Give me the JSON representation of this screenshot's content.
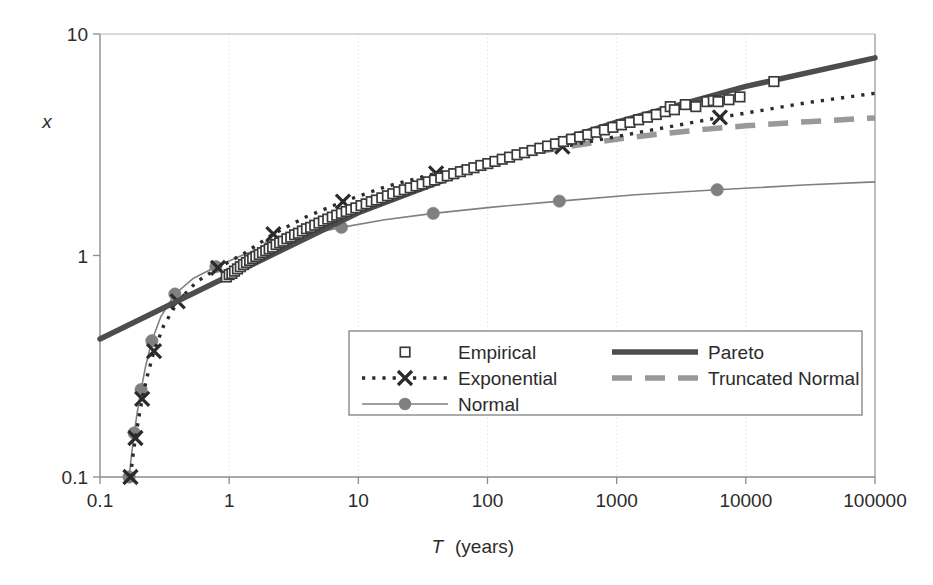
{
  "chart_data": {
    "type": "line",
    "title": "",
    "xlabel": "T (years)",
    "xlabel_symbol": "T",
    "xlabel_unit": "(years)",
    "ylabel": "x",
    "xscale": "log",
    "yscale": "log",
    "xlim": [
      0.1,
      100000
    ],
    "ylim": [
      0.1,
      10
    ],
    "xticks": [
      "0.1",
      "1",
      "10",
      "100",
      "1000",
      "10000",
      "100000"
    ],
    "xtick_values": [
      0.1,
      1,
      10,
      100,
      1000,
      10000,
      100000
    ],
    "yticks": [
      "0.1",
      "1",
      "10"
    ],
    "ytick_values": [
      0.1,
      1,
      10
    ],
    "grid": "vertical-dotted-at-decades",
    "legend_position": "lower-center",
    "series": [
      {
        "name": "Empirical",
        "marker": "open-square",
        "line": "none",
        "color": "#3a3a3a",
        "points": [
          [
            0.95,
            0.8
          ],
          [
            1.0,
            0.82
          ],
          [
            1.05,
            0.83
          ],
          [
            1.1,
            0.85
          ],
          [
            1.16,
            0.87
          ],
          [
            1.22,
            0.89
          ],
          [
            1.29,
            0.91
          ],
          [
            1.36,
            0.93
          ],
          [
            1.44,
            0.95
          ],
          [
            1.52,
            0.97
          ],
          [
            1.61,
            0.99
          ],
          [
            1.71,
            1.01
          ],
          [
            1.81,
            1.03
          ],
          [
            1.92,
            1.05
          ],
          [
            2.04,
            1.07
          ],
          [
            2.17,
            1.09
          ],
          [
            2.31,
            1.12
          ],
          [
            2.46,
            1.14
          ],
          [
            2.62,
            1.16
          ],
          [
            2.8,
            1.19
          ],
          [
            3.0,
            1.21
          ],
          [
            3.21,
            1.24
          ],
          [
            3.44,
            1.26
          ],
          [
            3.69,
            1.29
          ],
          [
            3.97,
            1.32
          ],
          [
            4.27,
            1.34
          ],
          [
            4.6,
            1.37
          ],
          [
            4.96,
            1.4
          ],
          [
            5.36,
            1.43
          ],
          [
            5.8,
            1.46
          ],
          [
            6.28,
            1.49
          ],
          [
            6.81,
            1.52
          ],
          [
            7.4,
            1.55
          ],
          [
            8.05,
            1.58
          ],
          [
            8.77,
            1.61
          ],
          [
            9.57,
            1.64
          ],
          [
            10.5,
            1.68
          ],
          [
            11.5,
            1.71
          ],
          [
            12.6,
            1.75
          ],
          [
            13.8,
            1.78
          ],
          [
            15.2,
            1.82
          ],
          [
            16.8,
            1.86
          ],
          [
            18.5,
            1.9
          ],
          [
            20.5,
            1.94
          ],
          [
            22.7,
            1.98
          ],
          [
            25.2,
            2.02
          ],
          [
            28.0,
            2.06
          ],
          [
            31.2,
            2.1
          ],
          [
            34.8,
            2.15
          ],
          [
            38.9,
            2.19
          ],
          [
            43.5,
            2.24
          ],
          [
            48.8,
            2.29
          ],
          [
            54.8,
            2.34
          ],
          [
            61.7,
            2.39
          ],
          [
            69.5,
            2.44
          ],
          [
            78.5,
            2.49
          ],
          [
            88.8,
            2.55
          ],
          [
            100.6,
            2.6
          ],
          [
            114.2,
            2.66
          ],
          [
            130.0,
            2.72
          ],
          [
            148.2,
            2.78
          ],
          [
            169.2,
            2.85
          ],
          [
            193.5,
            2.91
          ],
          [
            221.6,
            2.98
          ],
          [
            254.2,
            3.05
          ],
          [
            292.0,
            3.12
          ],
          [
            336.0,
            3.19
          ],
          [
            387.2,
            3.27
          ],
          [
            447.0,
            3.35
          ],
          [
            516.6,
            3.43
          ],
          [
            597.8,
            3.51
          ],
          [
            693.0,
            3.6
          ],
          [
            804.5,
            3.69
          ],
          [
            935.0,
            3.79
          ],
          [
            1088.0,
            3.89
          ],
          [
            1268.0,
            3.99
          ],
          [
            1480.0,
            4.1
          ],
          [
            1731.0,
            4.21
          ],
          [
            2028.0,
            4.33
          ],
          [
            2380.0,
            4.46
          ],
          [
            2600.0,
            4.7
          ],
          [
            2800.0,
            4.55
          ],
          [
            3400.0,
            4.8
          ],
          [
            4100.0,
            4.7
          ],
          [
            5000.0,
            4.95
          ],
          [
            5600.0,
            5.0
          ],
          [
            6100.0,
            4.95
          ],
          [
            7400.0,
            5.05
          ],
          [
            9000.0,
            5.2
          ],
          [
            16500.0,
            6.1
          ]
        ]
      },
      {
        "name": "Exponential",
        "marker": "x",
        "line": "dotted",
        "color": "#2b2b2b",
        "points": [
          [
            0.172,
            0.1
          ],
          [
            0.18,
            0.125
          ],
          [
            0.188,
            0.15
          ],
          [
            0.198,
            0.18
          ],
          [
            0.212,
            0.225
          ],
          [
            0.232,
            0.285
          ],
          [
            0.262,
            0.37
          ],
          [
            0.31,
            0.48
          ],
          [
            0.4,
            0.62
          ],
          [
            0.56,
            0.76
          ],
          [
            0.82,
            0.88
          ],
          [
            1.3,
            1.02
          ],
          [
            2.2,
            1.25
          ],
          [
            4.0,
            1.5
          ],
          [
            7.6,
            1.75
          ],
          [
            16.5,
            2.05
          ],
          [
            40.0,
            2.35
          ],
          [
            110.0,
            2.7
          ],
          [
            380.0,
            3.1
          ],
          [
            1500.0,
            3.6
          ],
          [
            6300.0,
            4.2
          ],
          [
            30000.0,
            4.9
          ],
          [
            100000.0,
            5.4
          ]
        ],
        "x_markers": [
          [
            0.172,
            0.1
          ],
          [
            0.188,
            0.15
          ],
          [
            0.212,
            0.225
          ],
          [
            0.262,
            0.37
          ],
          [
            0.4,
            0.62
          ],
          [
            0.82,
            0.88
          ],
          [
            2.2,
            1.25
          ],
          [
            7.6,
            1.75
          ],
          [
            40.0,
            2.35
          ],
          [
            380.0,
            3.1
          ],
          [
            6300.0,
            4.2
          ]
        ]
      },
      {
        "name": "Normal",
        "marker": "filled-circle",
        "line": "thin-solid",
        "color": "#808080",
        "points": [
          [
            0.168,
            0.1
          ],
          [
            0.176,
            0.128
          ],
          [
            0.184,
            0.158
          ],
          [
            0.194,
            0.195
          ],
          [
            0.208,
            0.248
          ],
          [
            0.226,
            0.318
          ],
          [
            0.252,
            0.412
          ],
          [
            0.296,
            0.53
          ],
          [
            0.38,
            0.67
          ],
          [
            0.53,
            0.79
          ],
          [
            0.79,
            0.89
          ],
          [
            1.25,
            1.0
          ],
          [
            2.1,
            1.12
          ],
          [
            3.9,
            1.24
          ],
          [
            7.4,
            1.34
          ],
          [
            16.0,
            1.45
          ],
          [
            38.0,
            1.55
          ],
          [
            105.0,
            1.65
          ],
          [
            360.0,
            1.76
          ],
          [
            1400.0,
            1.88
          ],
          [
            6000.0,
            1.98
          ],
          [
            28000.0,
            2.08
          ],
          [
            100000.0,
            2.15
          ]
        ],
        "circle_markers": [
          [
            0.168,
            0.1
          ],
          [
            0.184,
            0.158
          ],
          [
            0.208,
            0.248
          ],
          [
            0.252,
            0.412
          ],
          [
            0.38,
            0.67
          ],
          [
            0.79,
            0.89
          ],
          [
            2.1,
            1.12
          ],
          [
            7.4,
            1.34
          ],
          [
            38.0,
            1.55
          ],
          [
            360.0,
            1.76
          ],
          [
            6000.0,
            1.98
          ]
        ]
      },
      {
        "name": "Pareto",
        "marker": "none",
        "line": "thick-solid",
        "color": "#4d4d4d",
        "points": [
          [
            0.1,
            0.42
          ],
          [
            1.0,
            0.81
          ],
          [
            10.0,
            1.56
          ],
          [
            100.0,
            2.6
          ],
          [
            1000.0,
            4.0
          ],
          [
            10000.0,
            5.8
          ],
          [
            100000.0,
            7.8
          ]
        ]
      },
      {
        "name": "Truncated Normal",
        "marker": "none",
        "line": "thick-dashed",
        "color": "#999999",
        "points": [
          [
            250.0,
            2.95
          ],
          [
            500.0,
            3.15
          ],
          [
            1000.0,
            3.35
          ],
          [
            2000.0,
            3.52
          ],
          [
            5000.0,
            3.72
          ],
          [
            10000.0,
            3.85
          ],
          [
            30000.0,
            4.02
          ],
          [
            100000.0,
            4.18
          ]
        ]
      }
    ]
  },
  "legend": {
    "entries": [
      {
        "label": "Empirical",
        "marker": "open-square",
        "style": "marker-only",
        "column": 0
      },
      {
        "label": "Exponential",
        "marker": "x",
        "style": "dotted-with-marker",
        "column": 0
      },
      {
        "label": "Normal",
        "marker": "filled-circle",
        "style": "thin-line-with-marker",
        "column": 0
      },
      {
        "label": "Pareto",
        "marker": "none",
        "style": "thick-solid",
        "column": 1
      },
      {
        "label": "Truncated Normal",
        "marker": "none",
        "style": "thick-dashed",
        "column": 1
      }
    ]
  },
  "colors": {
    "axis": "#8c8c8c",
    "text": "#2b2b2b",
    "gridline": "#d9d9d9",
    "pareto": "#4d4d4d",
    "empirical": "#3a3a3a",
    "exponential": "#2b2b2b",
    "normal": "#808080",
    "truncated_normal": "#999999",
    "background": "#ffffff",
    "legend_border": "#808080"
  }
}
